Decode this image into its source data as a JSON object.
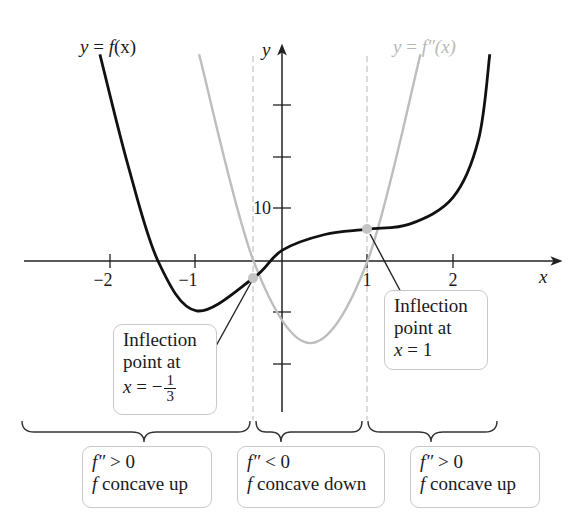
{
  "figure": {
    "f_label": "y = f(x)",
    "f_label_parts": {
      "y": "y",
      "eq": " = ",
      "f": "f",
      "arg": "(x)"
    },
    "fpp_label_parts": {
      "y": "y",
      "eq": " = ",
      "f": "f″",
      "arg": "(x)"
    },
    "axis_x_label": "x",
    "axis_y_label": "y",
    "x_ticks": [
      "−2",
      "−1",
      "1",
      "2"
    ],
    "y_tick_label": "10",
    "inflection_left": {
      "line1": "Inflection",
      "line2": "point at",
      "eq_x": "x",
      "eq": " = −",
      "num": "1",
      "den": "3"
    },
    "inflection_right": {
      "line1": "Inflection",
      "line2": "point at",
      "eq_x": "x",
      "eq": " = 1"
    },
    "regions": [
      {
        "line1_f": "f″",
        "line1_rest": " > 0",
        "line2_f": "f",
        "line2_rest": " concave up"
      },
      {
        "line1_f": "f″",
        "line1_rest": " < 0",
        "line2_f": "f",
        "line2_rest": " concave down"
      },
      {
        "line1_f": "f″",
        "line1_rest": " > 0",
        "line2_f": "f",
        "line2_rest": " concave up"
      }
    ],
    "colors": {
      "f_curve": "#111111",
      "fpp_curve": "#bdbdbd",
      "axes": "#222222",
      "dashed": "#c8c8c8",
      "point": "#c4c4c4"
    }
  },
  "chart_data": {
    "type": "line",
    "title": "",
    "xlabel": "x",
    "ylabel": "y",
    "x_ticks": [
      -2,
      -1,
      1,
      2
    ],
    "y_ticks": [
      10
    ],
    "xlim": [
      -3.1,
      3.0
    ],
    "series": [
      {
        "name": "y = f(x)",
        "points": [
          [
            -2.13,
            39
          ],
          [
            -1.8,
            18
          ],
          [
            -1.45,
            0
          ],
          [
            -1.0,
            -9.4
          ],
          [
            -0.333,
            -3.2
          ],
          [
            0,
            2
          ],
          [
            0.5,
            5
          ],
          [
            1,
            6
          ],
          [
            1.5,
            7
          ],
          [
            2,
            12
          ],
          [
            2.3,
            23
          ],
          [
            2.43,
            39
          ]
        ]
      },
      {
        "name": "y = f″(x)",
        "points": [
          [
            -0.97,
            39
          ],
          [
            -0.333,
            0
          ],
          [
            0.33,
            -15.5
          ],
          [
            1,
            0
          ],
          [
            1.62,
            39
          ]
        ]
      }
    ],
    "inflection_points": [
      [
        -0.333,
        -3.2
      ],
      [
        1,
        6
      ]
    ],
    "annotations": [
      "Inflection point at x = −1/3",
      "Inflection point at x = 1",
      "f″ > 0, f concave up",
      "f″ < 0, f concave down",
      "f″ > 0, f concave up"
    ]
  }
}
